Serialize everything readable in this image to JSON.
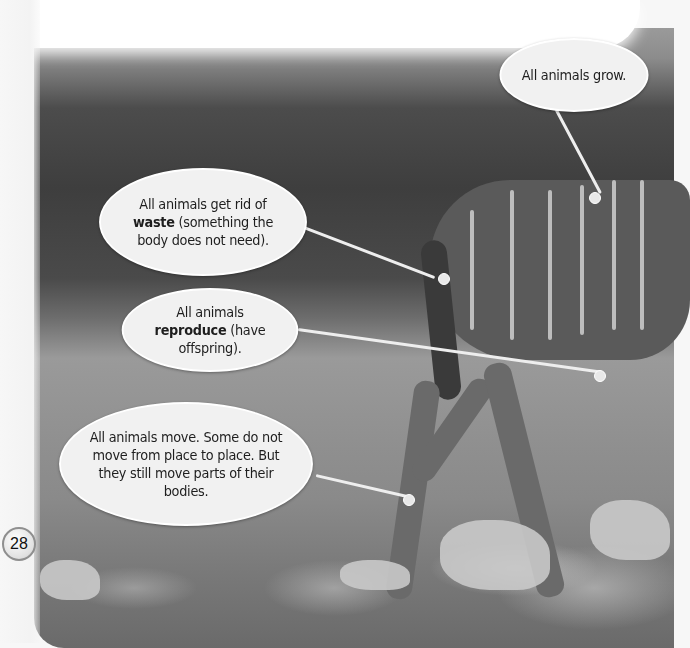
{
  "page": {
    "number": "28",
    "colors": {
      "background": "#f7f7f7",
      "bubble_fill": "#f1f1f1",
      "text": "#1e1e1e",
      "pointer": "#eeeeee"
    }
  },
  "photo": {
    "subject": "kudu standing on rocky ground",
    "mode": "grayscale"
  },
  "callouts": [
    {
      "id": "grow",
      "pre": "All animals grow.",
      "bold": "",
      "post": ""
    },
    {
      "id": "waste",
      "pre": "All animals get rid of ",
      "bold": "waste",
      "post": " (something the body does not need)."
    },
    {
      "id": "reproduce",
      "pre": "All animals ",
      "bold": "reproduce",
      "post": " (have offspring)."
    },
    {
      "id": "move",
      "pre": "All animals move. Some do not move from place to place. But they still move parts of their bodies.",
      "bold": "",
      "post": ""
    }
  ]
}
